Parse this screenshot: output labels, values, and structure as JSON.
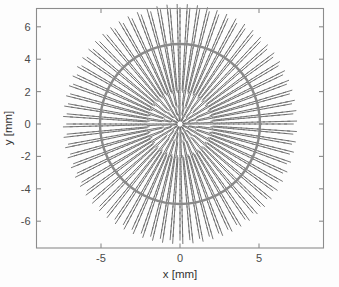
{
  "figure": {
    "title": "",
    "background_color": "#fdfdfd",
    "frame_color": "#8c8c8c"
  },
  "axes": {
    "x_label": "x [mm]",
    "y_label": "y [mm]",
    "x_ticks": [
      "-5",
      "0",
      "5"
    ],
    "x_tick_values": [
      -5,
      0,
      5
    ],
    "y_ticks": [
      "6",
      "4",
      "2",
      "0",
      "-2",
      "-4",
      "-6"
    ],
    "y_tick_values": [
      6,
      4,
      2,
      0,
      -2,
      -4,
      -6
    ],
    "x_range": [
      -9.11,
      9.11
    ],
    "y_range": [
      -7.65,
      7.16
    ],
    "grid": false,
    "tick_direction": "in"
  },
  "chart_data": {
    "type": "scatter",
    "title": "",
    "xlabel": "x [mm]",
    "ylabel": "y [mm]",
    "xlim": [
      -9.11,
      9.11
    ],
    "ylim": [
      -7.65,
      7.16
    ],
    "grid": false,
    "legend": "none",
    "series": [
      {
        "name": "radial-dash-field",
        "kind": "polar-dash-grid",
        "color": "#6f6f6f",
        "n_angular_spokes": 72,
        "angle_start_deg": 0,
        "angle_step_deg": 5,
        "n_radial_rings": 52,
        "radius_min_mm": 0.22,
        "radius_max_mm": 7.1,
        "dash_length_min_mm": 0.12,
        "dash_length_max_mm": 0.62,
        "dash_orientation": "radial",
        "note": "Dash length grows with radius; spacing between rings is approximately uniform at 0.135 mm."
      },
      {
        "name": "boundary-circle",
        "kind": "circle",
        "color": "#8a8a8a",
        "radius_mm": 5.0,
        "center_mm": [
          0,
          0
        ],
        "line_width": 2.4
      }
    ],
    "annotations": []
  },
  "colors": {
    "dash": "#6f6f6f",
    "circle": "#8a8a8a",
    "frame": "#8c8c8c",
    "text": "#333333",
    "tick_text": "#4a4a4a"
  }
}
